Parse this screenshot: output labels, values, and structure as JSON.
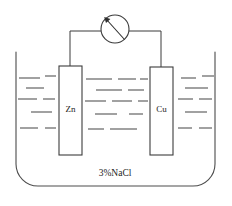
{
  "figure": {
    "caption": "3%NaCl",
    "electrodes": [
      {
        "label": "Zn",
        "name": "zinc-electrode",
        "x": 59,
        "y": 66,
        "width": 23,
        "height": 89
      },
      {
        "label": "Cu",
        "name": "copper-electrode",
        "x": 150,
        "y": 67,
        "width": 23,
        "height": 88
      }
    ],
    "meter": {
      "label": "",
      "cx": 115,
      "cy": 29,
      "r": 14
    },
    "vessel": {
      "left": 16,
      "right": 215,
      "top": 52,
      "bottom": 186,
      "corner_radius": 22
    },
    "electrolyte_color": "#555555",
    "outline_color": "#4c4c4c",
    "ink_color": "#1c1c1c",
    "liquid_dashes": [
      [
        19,
        78,
        40,
        78
      ],
      [
        45,
        76,
        56,
        76
      ],
      [
        26,
        88,
        44,
        88
      ],
      [
        18,
        99,
        37,
        99
      ],
      [
        43,
        99,
        55,
        99
      ],
      [
        31,
        112,
        52,
        112
      ],
      [
        20,
        128,
        38,
        128
      ],
      [
        45,
        128,
        56,
        128
      ],
      [
        86,
        79,
        112,
        79
      ],
      [
        118,
        79,
        136,
        79
      ],
      [
        140,
        79,
        148,
        79
      ],
      [
        96,
        90,
        122,
        90
      ],
      [
        128,
        90,
        144,
        90
      ],
      [
        85,
        101,
        106,
        101
      ],
      [
        112,
        101,
        132,
        101
      ],
      [
        138,
        101,
        148,
        101
      ],
      [
        95,
        114,
        117,
        114
      ],
      [
        129,
        114,
        143,
        114
      ],
      [
        88,
        129,
        104,
        129
      ],
      [
        110,
        129,
        137,
        129
      ],
      [
        181,
        78,
        196,
        78
      ],
      [
        202,
        76,
        214,
        76
      ],
      [
        185,
        88,
        208,
        88
      ],
      [
        178,
        99,
        193,
        99
      ],
      [
        199,
        99,
        212,
        99
      ],
      [
        185,
        112,
        207,
        112
      ],
      [
        178,
        128,
        192,
        128
      ],
      [
        199,
        128,
        212,
        128
      ]
    ],
    "wires": {
      "left_riser": {
        "x": 70,
        "y_top": 31,
        "y_bottom": 66
      },
      "left_horizontal": {
        "x_start": 70,
        "x_end": 101,
        "y": 31
      },
      "right_riser": {
        "x": 161,
        "y_top": 31,
        "y_bottom": 67
      },
      "right_horizontal": {
        "x_start": 129,
        "x_end": 161,
        "y": 31
      }
    }
  }
}
